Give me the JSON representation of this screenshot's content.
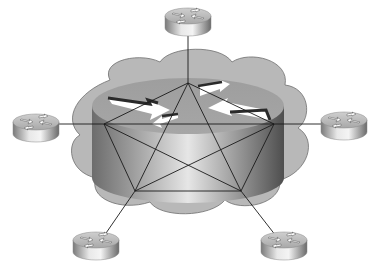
{
  "diagram": {
    "title": "Full-mesh routed network inside a cloud with five edge routers",
    "type": "network-topology",
    "colors": {
      "background": "#ffffff",
      "cloud_fill": "#b4b4b4",
      "cloud_stroke": "#6e6e6e",
      "router_light": "#e6e6e6",
      "router_dark": "#6a6a6a",
      "link": "#1a1a1a",
      "arrow_fill": "#ffffff",
      "arrow_shadow": "#2a2a2a"
    },
    "cloud": {
      "label": ""
    },
    "core_router": {
      "label": ""
    },
    "mesh_nodes": [
      {
        "id": "top",
        "x": 188,
        "y": 83
      },
      {
        "id": "left",
        "x": 104,
        "y": 124
      },
      {
        "id": "right",
        "x": 274,
        "y": 124
      },
      {
        "id": "bottom-left",
        "x": 135,
        "y": 191
      },
      {
        "id": "bottom-right",
        "x": 241,
        "y": 191
      }
    ],
    "edge_routers": [
      {
        "id": "router-top",
        "label": "",
        "attached_to": "top"
      },
      {
        "id": "router-left",
        "label": "",
        "attached_to": "left"
      },
      {
        "id": "router-right",
        "label": "",
        "attached_to": "right"
      },
      {
        "id": "router-bottom-left",
        "label": "",
        "attached_to": "bottom-left"
      },
      {
        "id": "router-bottom-right",
        "label": "",
        "attached_to": "bottom-right"
      }
    ],
    "mesh_links": [
      [
        "top",
        "left"
      ],
      [
        "top",
        "right"
      ],
      [
        "top",
        "bottom-left"
      ],
      [
        "top",
        "bottom-right"
      ],
      [
        "left",
        "right"
      ],
      [
        "left",
        "bottom-left"
      ],
      [
        "left",
        "bottom-right"
      ],
      [
        "right",
        "bottom-left"
      ],
      [
        "right",
        "bottom-right"
      ],
      [
        "bottom-left",
        "bottom-right"
      ]
    ]
  }
}
